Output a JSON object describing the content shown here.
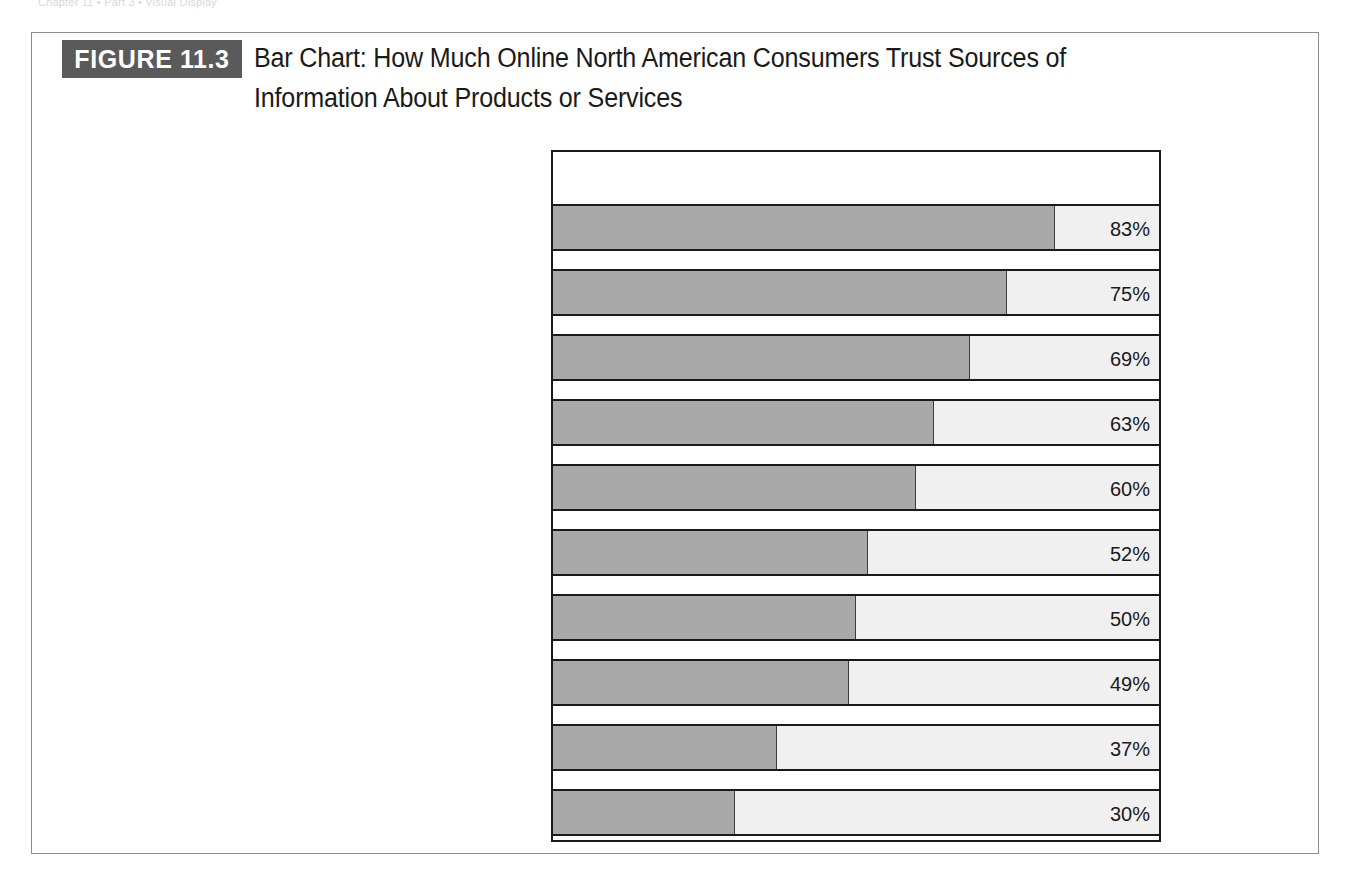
{
  "running_head": "Chapter 11  •  Part 3  •  Visual Display",
  "figure": {
    "badge": "FIGURE 11.3",
    "title": "Bar Chart: How Much Online North American Consumers Trust Sources of Information About Products or Services"
  },
  "chart_data": {
    "type": "bar",
    "orientation": "horizontal",
    "title": "Bar Chart: How Much Online North American Consumers Trust Sources of Information About Products or Services",
    "xlabel": "",
    "ylabel": "",
    "xlim": [
      0,
      100
    ],
    "grid": false,
    "legend": null,
    "value_suffix": "%",
    "bar_color": "#a9a9a9",
    "track_color": "#f0f0f0",
    "categories": [
      "Opinion of a friend or acquaintance\nwho has used the product or service",
      "A review of the product or service in\na newspaper, in a magazine, or on TV",
      "Information on the\nmanufacturer's website",
      "A review by a known expert",
      "Consumer reviews on a retailer's site",
      "Consumer reviews by\nusers of a content site",
      "Information at online\nconsumer opinion sites",
      "An online review by the\neditors of a content site",
      "Information in online chat\nrooms or discussion boards",
      "An online review by a blogger"
    ],
    "values": [
      83,
      75,
      69,
      63,
      60,
      52,
      50,
      49,
      37,
      30
    ],
    "value_labels": [
      "83%",
      "75%",
      "69%",
      "63%",
      "60%",
      "52%",
      "50%",
      "49%",
      "37%",
      "30%"
    ]
  }
}
